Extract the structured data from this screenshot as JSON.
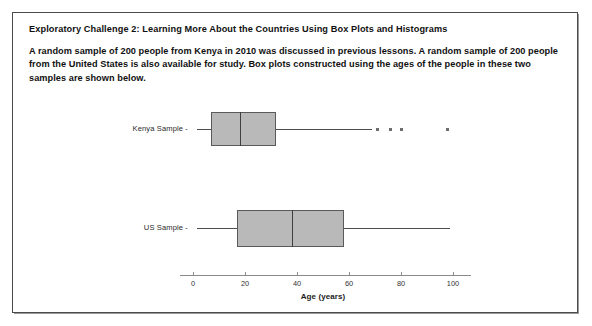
{
  "document": {
    "heading": "Exploratory Challenge 2:  Learning More About the Countries Using Box Plots and Histograms",
    "paragraph": "A random sample of 200 people from Kenya in 2010 was discussed in previous lessons.  A random sample of 200 people from the United States is also available for study.  Box plots constructed using the ages of the people in these two samples are shown below."
  },
  "chart_data": {
    "type": "box",
    "title": "",
    "xlabel": "Age (years)",
    "ylabel": "",
    "xlim": [
      -5,
      107
    ],
    "xticks": [
      0,
      20,
      40,
      60,
      80,
      100
    ],
    "xtick_labels": [
      "0",
      "20",
      "40",
      "60",
      "80",
      "100"
    ],
    "grid": false,
    "orientation": "horizontal",
    "categories": [
      "Kenya Sample",
      "US Sample"
    ],
    "boxes": [
      {
        "label": "Kenya Sample",
        "whisker_low": 1.5,
        "q1": 7,
        "median": 18,
        "q3": 32,
        "whisker_high": 69,
        "outliers": [
          71,
          76,
          80,
          98
        ]
      },
      {
        "label": "US Sample",
        "whisker_low": 1.5,
        "q1": 17,
        "median": 38,
        "q3": 58,
        "whisker_high": 99,
        "outliers": []
      }
    ],
    "colors": {
      "box_fill": "#b9b9b9",
      "box_edge": "#5a5a5a",
      "median": "#3f3f3f",
      "whisker": "#4d4d4d",
      "outlier": "#6e6e6e",
      "axis": "#8a8a8a"
    }
  }
}
